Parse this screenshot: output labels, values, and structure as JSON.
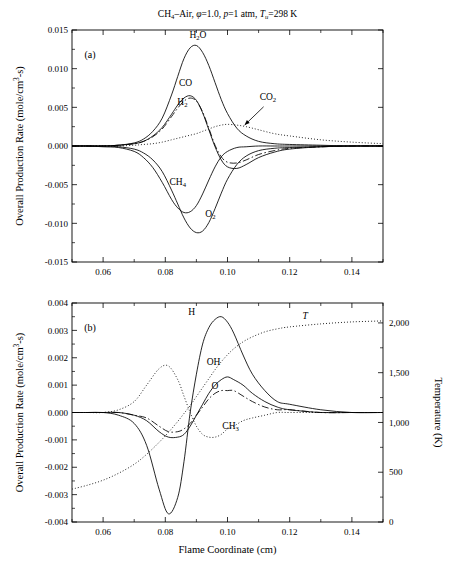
{
  "figure": {
    "title": "CH4–Air, φ=1.0, p=1 atm, Tu=298 K",
    "title_parts": {
      "ch": "CH",
      "ch_sub": "4",
      "dash_air": "–Air, ",
      "phi": "φ",
      "phi_val": "=1.0, ",
      "p": "p",
      "p_val": "=1 atm, ",
      "t": "T",
      "t_sub": "u",
      "t_val": "=298 K"
    },
    "xlabel": "Flame Coordinate (cm)",
    "panel_a_label": "(a)",
    "panel_b_label": "(b)"
  },
  "axes": {
    "ylabel_main": "Overall Production Rate (mole/cm",
    "ylabel_sup": "3",
    "ylabel_tail": "-s)",
    "ylabel_right": "Temperature (K)",
    "x_ticks": [
      "0.06",
      "0.08",
      "0.10",
      "0.12",
      "0.14"
    ],
    "x_tick_values": [
      0.06,
      0.08,
      0.1,
      0.12,
      0.14
    ],
    "x_range": [
      0.05,
      0.15
    ],
    "panel_a_y_ticks": [
      "0.015",
      "0.010",
      "0.005",
      "0.000",
      "-0.005",
      "-0.010",
      "-0.015"
    ],
    "panel_a_y_tick_values": [
      0.015,
      0.01,
      0.005,
      0.0,
      -0.005,
      -0.01,
      -0.015
    ],
    "panel_a_ylim": [
      -0.015,
      0.015
    ],
    "panel_b_y_ticks": [
      "0.004",
      "0.003",
      "0.002",
      "0.001",
      "0.000",
      "-0.001",
      "-0.002",
      "-0.003",
      "-0.004"
    ],
    "panel_b_y_tick_values": [
      0.004,
      0.003,
      0.002,
      0.001,
      0.0,
      -0.001,
      -0.002,
      -0.003,
      -0.004
    ],
    "panel_b_ylim": [
      -0.004,
      0.004
    ],
    "panel_b_y2_ticks": [
      "0",
      "500",
      "1,000",
      "1,500",
      "2,000"
    ],
    "panel_b_y2_tick_values": [
      0,
      500,
      1000,
      1500,
      2000
    ],
    "panel_b_y2lim": [
      0,
      2200
    ]
  },
  "chart_data": {
    "type": "line",
    "title": "CH4–Air, φ=1.0, p=1 atm, Tu=298 K",
    "xlabel": "Flame Coordinate (cm)",
    "ylabel": "Overall Production Rate (mole/cm3-s)",
    "grid": false,
    "legend": "inline-curve-labels",
    "panels": [
      {
        "id": "a",
        "label": "(a)",
        "ylabel": "Overall Production Rate (mole/cm3-s)",
        "xlim": [
          0.05,
          0.15
        ],
        "ylim": [
          -0.015,
          0.015
        ],
        "x": [
          0.05,
          0.055,
          0.06,
          0.065,
          0.07,
          0.073,
          0.076,
          0.079,
          0.082,
          0.084,
          0.086,
          0.088,
          0.09,
          0.092,
          0.094,
          0.096,
          0.098,
          0.1,
          0.103,
          0.106,
          0.11,
          0.115,
          0.12,
          0.13,
          0.14,
          0.15
        ],
        "series": [
          {
            "name": "H2O",
            "style": "solid",
            "values": [
              0.0,
              0.0,
              0.0,
              0.0001,
              0.0004,
              0.0009,
              0.0019,
              0.0036,
              0.0066,
              0.009,
              0.0113,
              0.0127,
              0.013,
              0.0121,
              0.0104,
              0.0082,
              0.006,
              0.0042,
              0.0023,
              0.0013,
              0.0006,
              0.0003,
              0.0002,
              0.0001,
              0.0,
              0.0
            ]
          },
          {
            "name": "CO",
            "style": "solid",
            "values": [
              0.0,
              0.0,
              0.0,
              0.0001,
              0.0003,
              0.0006,
              0.0013,
              0.0024,
              0.0041,
              0.0053,
              0.0062,
              0.0065,
              0.0059,
              0.0043,
              0.0021,
              -0.0001,
              -0.0018,
              -0.0027,
              -0.0029,
              -0.0024,
              -0.0015,
              -0.0008,
              -0.0004,
              -0.0001,
              0.0,
              0.0
            ]
          },
          {
            "name": "H2",
            "style": "dashdot",
            "values": [
              0.0,
              0.0,
              0.0,
              0.0001,
              0.0003,
              0.0006,
              0.0012,
              0.0022,
              0.0038,
              0.0049,
              0.0058,
              0.0062,
              0.0058,
              0.0044,
              0.0023,
              0.0001,
              -0.0014,
              -0.0021,
              -0.0022,
              -0.0018,
              -0.0011,
              -0.0006,
              -0.0003,
              -0.0001,
              0.0,
              0.0
            ]
          },
          {
            "name": "CO2",
            "style": "dotted",
            "values": [
              0.0,
              0.0,
              0.0,
              0.0,
              0.0001,
              0.0002,
              0.0003,
              0.0005,
              0.0008,
              0.001,
              0.0012,
              0.0014,
              0.0016,
              0.0019,
              0.0022,
              0.0025,
              0.0027,
              0.0028,
              0.0027,
              0.0025,
              0.0021,
              0.0016,
              0.0013,
              0.0008,
              0.0005,
              0.0003
            ]
          },
          {
            "name": "CH4",
            "style": "solid",
            "values": [
              0.0,
              0.0,
              -0.0001,
              -0.0002,
              -0.0007,
              -0.0015,
              -0.0028,
              -0.0047,
              -0.0069,
              -0.008,
              -0.0086,
              -0.0085,
              -0.0077,
              -0.0062,
              -0.0044,
              -0.0027,
              -0.0014,
              -0.0007,
              -0.0002,
              -0.0001,
              0.0,
              0.0,
              0.0,
              0.0,
              0.0,
              0.0
            ]
          },
          {
            "name": "O2",
            "style": "solid",
            "values": [
              0.0,
              0.0,
              0.0,
              -0.0001,
              -0.0004,
              -0.0009,
              -0.0018,
              -0.0033,
              -0.0057,
              -0.0075,
              -0.0093,
              -0.0106,
              -0.0112,
              -0.011,
              -0.0099,
              -0.0081,
              -0.0061,
              -0.0043,
              -0.0024,
              -0.0013,
              -0.0006,
              -0.0003,
              -0.0002,
              -0.0001,
              0.0,
              0.0
            ]
          }
        ],
        "annotations": [
          {
            "text": "H2O",
            "x": 0.0905,
            "y": 0.014
          },
          {
            "text": "CO",
            "x": 0.0865,
            "y": 0.0077
          },
          {
            "text": "H2",
            "x": 0.0855,
            "y": 0.0053
          },
          {
            "text": "CO2",
            "x": 0.113,
            "y": 0.006,
            "arrow_to": {
              "x": 0.1055,
              "y": 0.0027
            }
          },
          {
            "text": "CH4",
            "x": 0.084,
            "y": -0.005
          },
          {
            "text": "O2",
            "x": 0.0945,
            "y": -0.0092
          }
        ]
      },
      {
        "id": "b",
        "label": "(b)",
        "ylabel": "Overall Production Rate (mole/cm3-s)",
        "ylabel_right": "Temperature (K)",
        "xlim": [
          0.05,
          0.15
        ],
        "ylim": [
          -0.004,
          0.004
        ],
        "y2lim": [
          0,
          2200
        ],
        "x": [
          0.05,
          0.055,
          0.06,
          0.065,
          0.07,
          0.074,
          0.078,
          0.081,
          0.084,
          0.086,
          0.088,
          0.09,
          0.092,
          0.094,
          0.096,
          0.098,
          0.1,
          0.102,
          0.105,
          0.108,
          0.112,
          0.116,
          0.12,
          0.13,
          0.14,
          0.15
        ],
        "series": [
          {
            "name": "H",
            "style": "solid",
            "values": [
              0.0,
              0.0,
              0.0,
              -0.0001,
              -0.0004,
              -0.0012,
              -0.0028,
              -0.0037,
              -0.0031,
              -0.0018,
              0.0,
              0.0014,
              0.0025,
              0.0031,
              0.0034,
              0.0035,
              0.0033,
              0.0029,
              0.0021,
              0.0014,
              0.0008,
              0.0004,
              0.0003,
              0.0001,
              0.0,
              0.0
            ]
          },
          {
            "name": "OH",
            "style": "solid",
            "values": [
              0.0,
              0.0,
              0.0,
              0.0,
              -0.0001,
              -0.0003,
              -0.0007,
              -0.0009,
              -0.0009,
              -0.0008,
              -0.0005,
              -0.0001,
              0.0003,
              0.0007,
              0.001,
              0.0012,
              0.0013,
              0.0012,
              0.001,
              0.0007,
              0.0004,
              0.0002,
              0.0001,
              0.0,
              0.0,
              0.0
            ]
          },
          {
            "name": "O",
            "style": "dashdot",
            "values": [
              0.0,
              0.0,
              0.0,
              0.0,
              -0.0001,
              -0.0002,
              -0.0005,
              -0.0007,
              -0.0007,
              -0.0006,
              -0.0004,
              -0.0001,
              0.0002,
              0.0005,
              0.0007,
              0.0008,
              0.0008,
              0.0008,
              0.0006,
              0.0004,
              0.0002,
              0.0001,
              0.0001,
              0.0,
              0.0,
              0.0
            ]
          },
          {
            "name": "CH3",
            "style": "dotted",
            "values": [
              0.0,
              0.0,
              0.0,
              0.0001,
              0.0004,
              0.001,
              0.0016,
              0.0017,
              0.0012,
              0.0006,
              0.0,
              -0.0005,
              -0.0008,
              -0.0009,
              -0.0009,
              -0.0008,
              -0.0006,
              -0.0005,
              -0.0003,
              -0.0002,
              -0.0001,
              0.0,
              0.0,
              0.0,
              0.0,
              0.0
            ]
          },
          {
            "name": "T",
            "style": "dotted",
            "axis": "right",
            "values": [
              330,
              370,
              420,
              490,
              580,
              680,
              800,
              900,
              1010,
              1090,
              1170,
              1260,
              1350,
              1440,
              1530,
              1610,
              1680,
              1740,
              1810,
              1860,
              1910,
              1940,
              1960,
              1990,
              2010,
              2020
            ]
          }
        ],
        "annotations": [
          {
            "text": "H",
            "x": 0.0885,
            "y": 0.00355
          },
          {
            "text": "T",
            "x": 0.125,
            "y": 0.0034,
            "italic": true
          },
          {
            "text": "OH",
            "x": 0.0955,
            "y": 0.00175
          },
          {
            "text": "O",
            "x": 0.096,
            "y": 0.00085
          },
          {
            "text": "CH3",
            "x": 0.101,
            "y": -0.0006
          }
        ]
      }
    ]
  }
}
